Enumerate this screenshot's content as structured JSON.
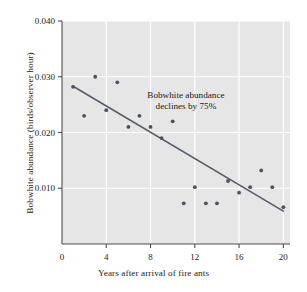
{
  "chart_data": {
    "type": "scatter",
    "title": "",
    "xlabel": "Years after arrival of fire ants",
    "ylabel": "Bobwhite abundance (birds/observer hour)",
    "xlim": [
      0,
      20.6
    ],
    "ylim": [
      0,
      0.04
    ],
    "xticks": [
      0,
      4,
      8,
      12,
      16,
      20
    ],
    "xticklabels": [
      "0",
      "4",
      "8",
      "12",
      "16",
      "20"
    ],
    "yticks": [
      0.01,
      0.02,
      0.03,
      0.04
    ],
    "yticklabels": [
      "0.010",
      "0.020",
      "0.030",
      "0.040"
    ],
    "grid": "white gridlines on gray panel",
    "legend": "none",
    "annotations": [
      {
        "name": "decline-annotation",
        "line1": "Bobwhite abundance",
        "line2": "declines by 75%",
        "x": 11.2,
        "y": 0.0262
      }
    ],
    "series": [
      {
        "name": "Bobwhite abundance observations",
        "type": "scatter",
        "marker": "filled-circle",
        "color": "#4a5260",
        "x": [
          1,
          2,
          3,
          4,
          5,
          6,
          7,
          8,
          9,
          10,
          11,
          12,
          13,
          14,
          15,
          16,
          17,
          18,
          19,
          20
        ],
        "y": [
          0.0282,
          0.023,
          0.03,
          0.024,
          0.029,
          0.021,
          0.023,
          0.021,
          0.019,
          0.022,
          0.0073,
          0.0102,
          0.0073,
          0.0073,
          0.0113,
          0.0092,
          0.0102,
          0.0132,
          0.0102,
          0.0066
        ]
      },
      {
        "name": "Trend line",
        "type": "line",
        "color": "#555d68",
        "x": [
          1,
          20
        ],
        "y": [
          0.0283,
          0.0059
        ]
      }
    ]
  },
  "colors": {
    "panel_background": "#e6e6e6",
    "gridline": "#ffffff",
    "point": "#4a5260",
    "trendline": "#555d68",
    "axis": "#4d4d4d",
    "text": "#1a1a1a",
    "page_background": "#ffffff"
  }
}
